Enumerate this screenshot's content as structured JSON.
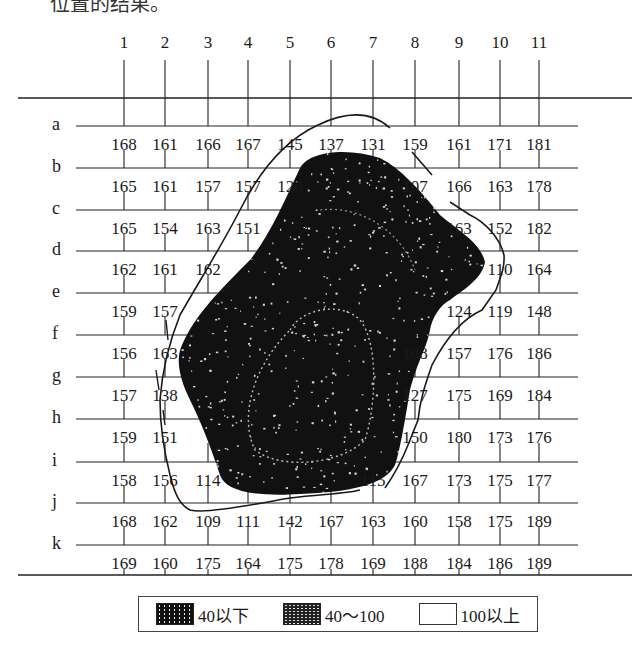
{
  "caption_fragment": "位置的结果。",
  "columns": [
    "1",
    "2",
    "3",
    "4",
    "5",
    "6",
    "7",
    "8",
    "9",
    "10",
    "11"
  ],
  "rows": [
    "a",
    "b",
    "c",
    "d",
    "e",
    "f",
    "g",
    "h",
    "i",
    "j",
    "k"
  ],
  "cells": {
    "a": [
      "168",
      "161",
      "166",
      "167",
      "145",
      "137",
      "131",
      "159",
      "161",
      "171",
      "181"
    ],
    "b": [
      "165",
      "161",
      "157",
      "157",
      "120",
      "",
      "",
      "107",
      "166",
      "163",
      "178"
    ],
    "c": [
      "165",
      "154",
      "163",
      "151",
      "",
      "",
      "",
      "",
      "163",
      "152",
      "182"
    ],
    "d": [
      "162",
      "161",
      "162",
      "",
      "",
      "",
      "",
      "",
      "",
      "110",
      "164"
    ],
    "e": [
      "159",
      "157",
      "",
      "",
      "",
      "",
      "",
      "",
      "124",
      "119",
      "148"
    ],
    "f": [
      "156",
      "163",
      "",
      "",
      "",
      "",
      "",
      "108",
      "157",
      "176",
      "186"
    ],
    "g": [
      "157",
      "138",
      "",
      "",
      "",
      "",
      "",
      "127",
      "175",
      "169",
      "184"
    ],
    "h": [
      "159",
      "151",
      "",
      "",
      "",
      "",
      "",
      "150",
      "180",
      "173",
      "176"
    ],
    "i": [
      "158",
      "156",
      "114",
      "",
      "",
      "",
      "115",
      "167",
      "173",
      "175",
      "177"
    ],
    "j": [
      "168",
      "162",
      "109",
      "111",
      "142",
      "167",
      "163",
      "160",
      "158",
      "175",
      "189"
    ],
    "k": [
      "169",
      "160",
      "175",
      "164",
      "175",
      "178",
      "169",
      "188",
      "184",
      "186",
      "189"
    ]
  },
  "legend": {
    "items": [
      {
        "label": "40以下",
        "pattern": "dark"
      },
      {
        "label": "40～100",
        "pattern": "mid"
      },
      {
        "label": "100以上",
        "pattern": "light"
      }
    ]
  },
  "colors": {
    "ink": "#1a1a1a",
    "dark_region": "#111111",
    "background": "#ffffff"
  }
}
